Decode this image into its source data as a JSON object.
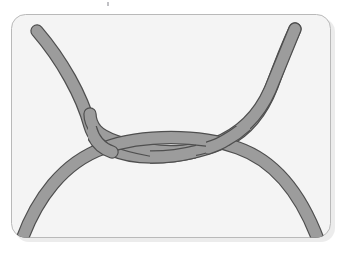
{
  "figure": {
    "kind": "knot-diagram",
    "panel": {
      "name": "rounded-rectangle-panel",
      "x": 11,
      "y": 14,
      "width": 320,
      "height": 224,
      "corner_radius": 14,
      "fill": "#f4f4f4",
      "border_color": "#b9b9b9",
      "border_width": 1,
      "shadow_color": "#d8d8d8"
    },
    "rope": {
      "name": "rope-strand",
      "fill": "#9c9c9c",
      "outline": "#4f4f4f",
      "outline_width": 1.2,
      "thickness": 11,
      "cap": "round"
    },
    "strands": [
      {
        "id": "arch-strand",
        "label": "lower arch strand",
        "endpoints": [
          "bottom-left",
          "bottom-right"
        ],
        "path": "M 20 239 C 38 196 66 160 104 147 C 140 135 200 135 236 147 C 274 160 302 198 320 239"
      },
      {
        "id": "left-descender",
        "label": "upper-left descending strand",
        "endpoints": [
          "top-left",
          "center-right"
        ],
        "path": "M 37 31 C 62 60 82 96 90 126 C 96 147 120 157 152 157 C 186 157 214 147 226 141 C 246 131 262 112 272 86 C 280 64 288 44 295 29"
      },
      {
        "id": "right-descender",
        "label": "upper-right descending strand",
        "endpoints": [
          "top-right",
          "center-left"
        ],
        "path": "M 295 29 C 288 44 280 64 272 86 C 262 112 246 131 226 141 C 214 147 186 157 152 157 C 120 157 96 147 90 126"
      }
    ],
    "crossings": [
      {
        "id": "crossing-left",
        "x": 110,
        "y": 150,
        "over": "arch-strand"
      },
      {
        "id": "crossing-middle",
        "x": 172,
        "y": 152,
        "over": "left-descender"
      },
      {
        "id": "crossing-right",
        "x": 228,
        "y": 150,
        "over": "arch-strand"
      }
    ],
    "artifact": {
      "name": "speck",
      "x": 107,
      "y": 2
    }
  }
}
